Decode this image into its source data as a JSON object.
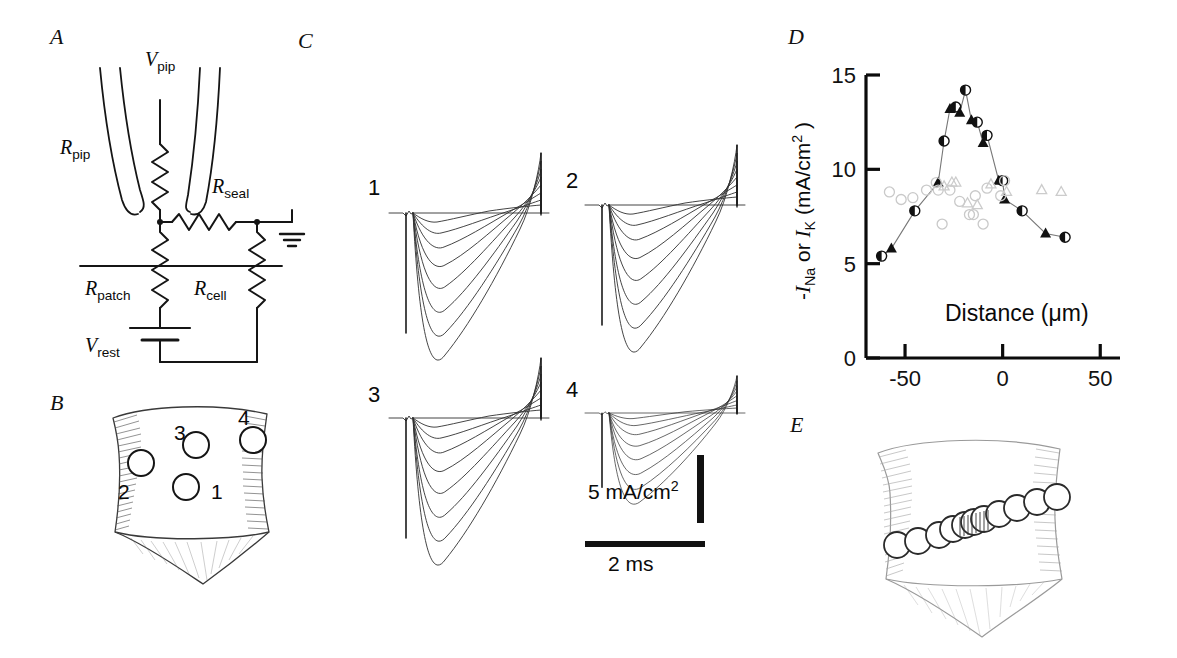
{
  "figure": {
    "panels": [
      {
        "id": "A",
        "label": "A",
        "x": 50,
        "y": 24
      },
      {
        "id": "B",
        "label": "B",
        "x": 50,
        "y": 390
      },
      {
        "id": "C",
        "label": "C",
        "x": 298,
        "y": 28
      },
      {
        "id": "D",
        "label": "D",
        "x": 788,
        "y": 24
      },
      {
        "id": "E",
        "label": "E",
        "x": 790,
        "y": 412
      }
    ]
  },
  "panelA": {
    "title": "patch-clamp equivalent circuit",
    "labels": {
      "v_pip": "V",
      "v_pip_sub": "pip",
      "r_pip": "R",
      "r_pip_sub": "pip",
      "r_seal": "R",
      "r_seal_sub": "seal",
      "r_patch": "R",
      "r_patch_sub": "patch",
      "r_cell": "R",
      "r_cell_sub": "cell",
      "v_rest": "V",
      "v_rest_sub": "rest"
    }
  },
  "panelB": {
    "title": "cell with four recording sites",
    "sites": [
      {
        "label": "1",
        "cx": 186,
        "cy": 487,
        "lx": 210,
        "ly": 492
      },
      {
        "label": "2",
        "cx": 141,
        "cy": 463,
        "lx": 118,
        "ly": 492
      },
      {
        "label": "3",
        "cx": 196,
        "cy": 445,
        "lx": 175,
        "ly": 433
      },
      {
        "label": "4",
        "cx": 253,
        "cy": 440,
        "lx": 239,
        "ly": 418
      }
    ]
  },
  "panelC": {
    "title": "current traces at four sites",
    "traces": [
      {
        "label": "1",
        "x": 370,
        "y": 190
      },
      {
        "label": "2",
        "x": 566,
        "y": 180
      },
      {
        "label": "3",
        "x": 370,
        "y": 400
      },
      {
        "label": "4",
        "x": 568,
        "y": 390
      }
    ],
    "scalebars": {
      "current_value": "5 mA/cm",
      "current_exp": "2",
      "time_value": "2 ms"
    }
  },
  "panelD": {
    "title": "peak current versus distance"
  },
  "chart_data": {
    "type": "scatter",
    "title": "",
    "xlabel": "Distance (μm)",
    "ylabel_parts": {
      "minus": "-",
      "I1": "I",
      "I1_sub": "Na",
      "or": " or ",
      "I2": "I",
      "I2_sub": "K",
      "units": " (mA/cm",
      "units_exp": "2",
      "close": " )"
    },
    "ylabel": "-I_Na or I_K (mA/cm2)",
    "xlim": [
      -70,
      55
    ],
    "ylim": [
      0,
      15
    ],
    "xticks": [
      -50,
      0,
      50
    ],
    "xticklabels": [
      "-50",
      "0",
      "50"
    ],
    "yticks": [
      0,
      5,
      10,
      15
    ],
    "yticklabels": [
      "0",
      "5",
      "10",
      "15"
    ],
    "grid": false,
    "legend": "none",
    "series": [
      {
        "name": "-I_Na (filled, connected)",
        "marker": "filled-circle-triangle",
        "connected": true,
        "x": [
          -62,
          -57,
          -45,
          -33,
          -30,
          -27,
          -24,
          -22,
          -19,
          -16,
          -13,
          -10,
          -8,
          -2,
          0,
          1,
          10,
          22,
          32
        ],
        "y": [
          5.4,
          5.8,
          7.8,
          9.3,
          11.5,
          13.2,
          13.3,
          13.0,
          14.2,
          12.6,
          12.5,
          11.4,
          11.8,
          9.4,
          9.4,
          8.4,
          7.8,
          6.6,
          6.4
        ]
      },
      {
        "name": "I_K (open circles)",
        "marker": "open-circle",
        "connected": false,
        "x": [
          -58,
          -52,
          -46,
          -39,
          -34,
          -33,
          -31,
          -27,
          -22,
          -17,
          -15,
          -14,
          -10,
          -8,
          -1,
          1
        ],
        "y": [
          8.8,
          8.4,
          8.5,
          8.9,
          9.3,
          8.9,
          7.1,
          8.9,
          8.3,
          7.6,
          7.6,
          8.6,
          7.1,
          9.0,
          8.6,
          9.4
        ]
      },
      {
        "name": "I_K (open triangles)",
        "marker": "open-triangle",
        "connected": false,
        "x": [
          -30,
          -26,
          -24,
          -18,
          -13,
          -6,
          2,
          20,
          30
        ],
        "y": [
          9.1,
          9.3,
          9.3,
          8.2,
          8.1,
          9.2,
          8.8,
          8.9,
          8.8
        ]
      }
    ]
  },
  "panelE": {
    "title": "cell with scan line of recording sites",
    "site_count": 11
  }
}
